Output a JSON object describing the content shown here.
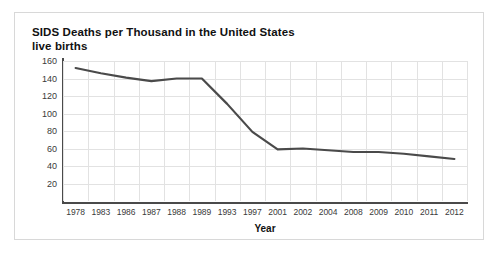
{
  "card": {
    "background_color": "#ffffff",
    "border_color": "#d8d8d8"
  },
  "chart_data": {
    "type": "line",
    "title": "SIDS Deaths per Thousand in the United States\nlive births",
    "xlabel": "Year",
    "ylabel": "",
    "categories": [
      "1978",
      "1983",
      "1986",
      "1987",
      "1988",
      "1989",
      "1993",
      "1997",
      "2001",
      "2002",
      "2004",
      "2008",
      "2009",
      "2010",
      "2011",
      "2012"
    ],
    "values": [
      152,
      146,
      141,
      137,
      140,
      140,
      111,
      79,
      59,
      60,
      58,
      56,
      56,
      54,
      51,
      48
    ],
    "series": [
      {
        "name": "SIDS deaths per thousand live births",
        "values": [
          152,
          146,
          141,
          137,
          140,
          140,
          111,
          79,
          59,
          60,
          58,
          56,
          56,
          54,
          51,
          48
        ],
        "color": "#4a4a4a"
      }
    ],
    "ylim": [
      0,
      160
    ],
    "yticks": [
      160,
      140,
      120,
      100,
      80,
      60,
      40,
      20
    ],
    "grid": true,
    "legend": "none",
    "line_color": "#4a4a4a",
    "gridline_color": "#e2e2e2",
    "axis_color": "#4a4a4a"
  }
}
